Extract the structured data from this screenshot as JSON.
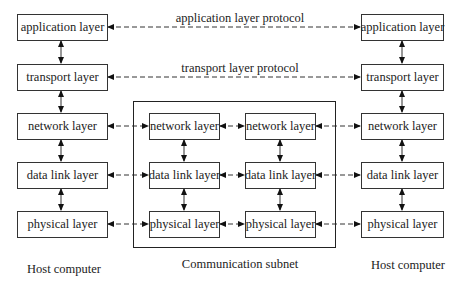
{
  "protocols": {
    "application": "application layer protocol",
    "transport": "transport layer protocol"
  },
  "left_host": {
    "caption": "Host computer",
    "layers": [
      "application layer",
      "transport layer",
      "network layer",
      "data link layer",
      "physical layer"
    ]
  },
  "right_host": {
    "caption": "Host computer",
    "layers": [
      "application layer",
      "transport layer",
      "network layer",
      "data link layer",
      "physical layer"
    ]
  },
  "subnet": {
    "caption": "Communication subnet",
    "node_a": [
      "network layer",
      "data link layer",
      "physical layer"
    ],
    "node_b": [
      "network layer",
      "data link layer",
      "physical layer"
    ]
  }
}
